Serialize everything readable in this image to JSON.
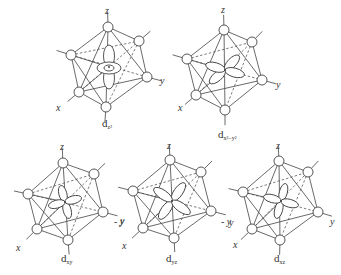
{
  "figure": {
    "colors": {
      "line": "#444444",
      "background": "#ffffff"
    },
    "panels": [
      {
        "id": "dz2",
        "orbital_main": "d",
        "orbital_sub": "z²",
        "axis_labels": {
          "z": "z",
          "x": "x",
          "y": "y"
        },
        "lobe_type": "dz2",
        "center": [
          109,
          67
        ],
        "vertices": {
          "top": [
            108,
            27
          ],
          "ur": [
            139,
            41
          ],
          "left": [
            71,
            55
          ],
          "right": [
            147,
            77
          ],
          "ll": [
            79,
            92
          ],
          "bottom": [
            106,
            107
          ]
        },
        "label_pos": [
          102,
          127
        ],
        "z_pos": [
          105,
          14
        ],
        "x_pos": [
          56,
          111
        ],
        "y_pos": [
          160,
          84
        ]
      },
      {
        "id": "dx2-y2",
        "orbital_main": "d",
        "orbital_sub": "x²−y²",
        "axis_labels": {
          "z": "z",
          "x": "x",
          "y": "y"
        },
        "lobe_type": "dx2y2",
        "center": [
          225,
          70
        ],
        "vertices": {
          "top": [
            224,
            30
          ],
          "ur": [
            252,
            42
          ],
          "left": [
            187,
            59
          ],
          "right": [
            262,
            80
          ],
          "ll": [
            196,
            95
          ],
          "bottom": [
            225,
            110
          ]
        },
        "label_pos": [
          218,
          138
        ],
        "z_pos": [
          221,
          13
        ],
        "x_pos": [
          178,
          111
        ],
        "y_pos": [
          276,
          88
        ]
      },
      {
        "id": "dxy",
        "orbital_main": "d",
        "orbital_sub": "xy",
        "axis_labels": {
          "z": "z",
          "x": "x",
          "y": "y"
        },
        "lobe_type": "dxy",
        "center": [
          65,
          202
        ],
        "vertices": {
          "top": [
            63,
            163
          ],
          "ur": [
            94,
            174
          ],
          "left": [
            28,
            194
          ],
          "right": [
            103,
            212
          ],
          "ll": [
            37,
            229
          ],
          "bottom": [
            68,
            240
          ]
        },
        "label_pos": [
          61,
          262
        ],
        "z_pos": [
          60,
          150
        ],
        "x_pos": [
          16,
          251
        ],
        "y_pos": [
          120,
          224
        ]
      },
      {
        "id": "dyz",
        "orbital_main": "d",
        "orbital_sub": "yz",
        "axis_labels": {
          "z": "z",
          "x": "x",
          "y": "y"
        },
        "lobe_type": "dyz",
        "center": [
          172,
          201
        ],
        "vertices": {
          "top": [
            170,
            160
          ],
          "ur": [
            201,
            172
          ],
          "left": [
            133,
            191
          ],
          "right": [
            211,
            211
          ],
          "ll": [
            143,
            228
          ],
          "bottom": [
            174,
            238
          ]
        },
        "label_pos": [
          166,
          262
        ],
        "z_pos": [
          167,
          149
        ],
        "x_pos": [
          122,
          249
        ],
        "y_pos": [
          229,
          226
        ]
      },
      {
        "id": "dxz",
        "orbital_main": "d",
        "orbital_sub": "xz",
        "axis_labels": {
          "z": "z",
          "x": "x",
          "y": "y"
        },
        "lobe_type": "dxz",
        "center": [
          281,
          201
        ],
        "vertices": {
          "top": [
            279,
            161
          ],
          "ur": [
            308,
            172
          ],
          "left": [
            243,
            192
          ],
          "right": [
            318,
            212
          ],
          "ll": [
            252,
            229
          ],
          "bottom": [
            280,
            240
          ]
        },
        "label_pos": [
          274,
          262
        ],
        "z_pos": [
          276,
          149
        ],
        "x_pos": [
          233,
          248
        ],
        "y_pos": [
          330,
          225
        ]
      }
    ],
    "extra_axis_labels": [
      {
        "text": "y",
        "pos": [
          114,
          225
        ]
      },
      {
        "text": "y",
        "pos": [
          221,
          225
        ]
      }
    ]
  }
}
